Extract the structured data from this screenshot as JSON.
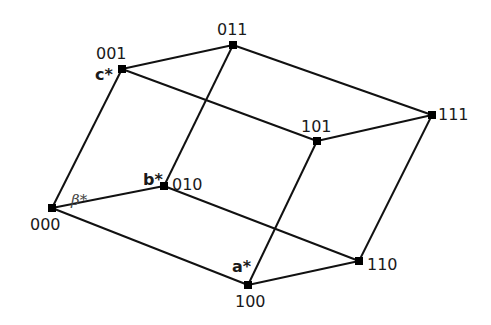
{
  "vertices": [
    {
      "id": "000",
      "label": "000",
      "x": 52,
      "y": 208
    },
    {
      "id": "100",
      "label": "100",
      "x": 248,
      "y": 285
    },
    {
      "id": "010",
      "label": "010",
      "x": 164,
      "y": 186
    },
    {
      "id": "001",
      "label": "001",
      "x": 122,
      "y": 69
    },
    {
      "id": "110",
      "label": "110",
      "x": 359,
      "y": 261
    },
    {
      "id": "011",
      "label": "011",
      "x": 233,
      "y": 45
    },
    {
      "id": "101",
      "label": "101",
      "x": 317,
      "y": 141
    },
    {
      "id": "111",
      "label": "111",
      "x": 432,
      "y": 115
    }
  ],
  "edges": [
    [
      "000",
      "100"
    ],
    [
      "000",
      "010"
    ],
    [
      "000",
      "001"
    ],
    [
      "100",
      "110"
    ],
    [
      "100",
      "101"
    ],
    [
      "010",
      "110"
    ],
    [
      "010",
      "011"
    ],
    [
      "001",
      "011"
    ],
    [
      "001",
      "101"
    ],
    [
      "110",
      "111"
    ],
    [
      "011",
      "111"
    ],
    [
      "101",
      "111"
    ]
  ],
  "axis_labels": {
    "a": "a*",
    "b": "b*",
    "c": "c*",
    "beta": "β*"
  },
  "vertex_labels": {
    "v000": "000",
    "v100": "100",
    "v010": "010",
    "v001": "001",
    "v110": "110",
    "v011": "011",
    "v101": "101",
    "v111": "111"
  }
}
